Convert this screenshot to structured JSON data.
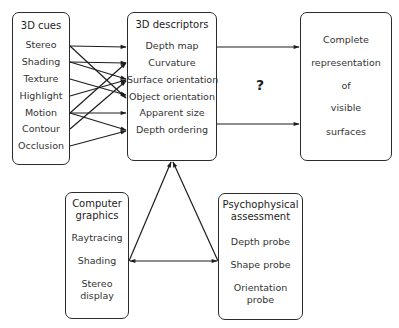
{
  "cues": {
    "title": "3D cues",
    "items": [
      "Stereo",
      "Shading",
      "Texture",
      "Highlight",
      "Motion",
      "Contour",
      "Occlusion"
    ]
  },
  "descriptors": {
    "title": "3D descriptors",
    "items": [
      "Depth map",
      "Curvature",
      "Surface orientation",
      "Object orientation",
      "Apparent size",
      "Depth ordering"
    ]
  },
  "unknown_mapping": "?",
  "representation": {
    "lines": [
      "Complete",
      "representation",
      "of",
      "visible",
      "surfaces"
    ]
  },
  "graphics": {
    "title_lines": [
      "Computer",
      "graphics"
    ],
    "items": [
      "Raytracing",
      "Shading"
    ],
    "item_multiline": [
      "Stereo",
      "display"
    ]
  },
  "psycho": {
    "title_lines": [
      "Psychophysical",
      "assessment"
    ],
    "items": [
      "Depth probe",
      "Shape probe"
    ],
    "item_multiline": [
      "Orientation",
      "probe"
    ]
  },
  "colors": {
    "ink": "#2b2b2b",
    "background": "#ffffff"
  }
}
